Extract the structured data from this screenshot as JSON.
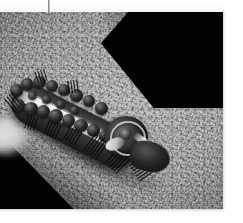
{
  "image": {
    "kind": "photograph",
    "subject": "caterpillar",
    "subject_detail": "spiny caterpillar with pale dorsal stripe",
    "tone": "monochrome",
    "caption": "",
    "alt_text": "Black-and-white photograph of a spiny caterpillar with a light dorsal stripe resting on a coarse gray textured surface, with dark shadowed areas in the upper-right and lower-left corners."
  },
  "frame": {
    "photo_left": 0,
    "photo_top": 12,
    "photo_width": 223,
    "photo_height": 197,
    "margin_color": "#ffffff"
  },
  "marks": {
    "crop_tick_label": "",
    "crop_tick_color": "#8f8f8f"
  },
  "palette": {
    "paper": "#ffffff",
    "ground_light": "#b3b3b3",
    "ground_mid": "#9a9a9a",
    "ground_dark": "#6f6f6f",
    "shadow_black": "#050505",
    "stripe_highlight": "#f2f2f2",
    "body_dark": "#1d1d1d"
  },
  "regions": {
    "top_right_shadow": "dark shadowed corner",
    "bottom_left_shadow": "dark shadowed corner",
    "left_blur": "out-of-focus pale blob at left margin",
    "ground": "coarse textured gray surface"
  }
}
